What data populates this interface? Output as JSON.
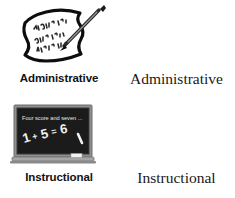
{
  "page": {
    "background_color": "#ffffff",
    "ink_color": "#121212",
    "width": 235,
    "height": 198
  },
  "rows": [
    {
      "key": "administrative",
      "icon_name": "handwritten-list-with-pen-icon",
      "icon_label": "Administrative",
      "text_label": "Administrative",
      "icon_details": {
        "type": "paper-note",
        "handwritten_lines": [
          "Bobby R.",
          "Suzie B.",
          "Nichole A."
        ],
        "pen": "diagonal-pen",
        "paper_color": "#ffffff",
        "outline_color": "#0d0d0d"
      }
    },
    {
      "key": "instructional",
      "icon_name": "chalkboard-icon",
      "icon_label": "Instructional",
      "text_label": "Instructional",
      "icon_details": {
        "type": "chalkboard",
        "board_color": "#1c1c1c",
        "frame_color": "#8f8f8f",
        "chalk_color": "#f2f2f2",
        "board_line_1": "Four score and seven ...",
        "board_line_2": "1 + 5 = 6",
        "tray_items": [
          "chalk-stick",
          "eraser"
        ]
      }
    }
  ]
}
